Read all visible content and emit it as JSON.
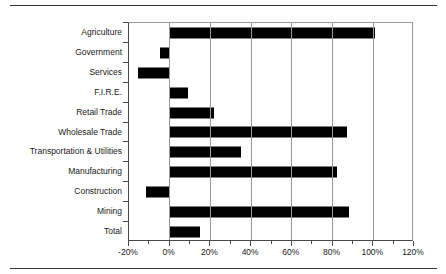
{
  "chart_data": {
    "type": "bar",
    "orientation": "horizontal",
    "title": "",
    "subtitle": "",
    "xlabel": "",
    "ylabel": "",
    "categories": [
      "Agriculture",
      "Government",
      "Services",
      "F.I.R.E.",
      "Retail Trade",
      "Wholesale Trade",
      "Transportation & Utilities",
      "Manufacturing",
      "Construction",
      "Mining",
      "Total"
    ],
    "values": [
      101,
      -5,
      -15.5,
      9,
      22,
      87,
      35,
      82,
      -11.5,
      88,
      15
    ],
    "value_unit": "%",
    "xlim": [
      -20,
      120
    ],
    "xticks": [
      -20,
      0,
      20,
      40,
      60,
      80,
      100,
      120
    ],
    "xticklabels": [
      "-20%",
      "0%",
      "20%",
      "40%",
      "60%",
      "80%",
      "100%",
      "120%"
    ],
    "minor_xtick_interval": 10,
    "grid": "vertical-major",
    "legend": "none",
    "bar_color": "#000000",
    "gridline_color": "#9a9a9a",
    "axis_color": "#4a4a4a",
    "plot_background": "#ffffff"
  },
  "figure": {
    "rule_color": "#333333"
  }
}
